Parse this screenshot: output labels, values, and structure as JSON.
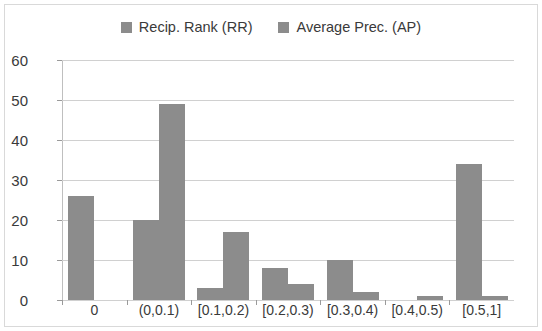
{
  "chart_data": {
    "type": "bar",
    "title": "",
    "subtitle": "",
    "xlabel": "",
    "ylabel": "",
    "categories": [
      "0",
      "(0,0.1)",
      "[0.1,0.2)",
      "[0.2,0.3)",
      "[0.3,0.4)",
      "[0.4,0.5)",
      "[0.5,1]"
    ],
    "series": [
      {
        "name": "Recip. Rank (RR)",
        "color": "#8c8c8c",
        "values": [
          26,
          20,
          3,
          8,
          10,
          0,
          34
        ]
      },
      {
        "name": "Average Prec. (AP)",
        "color": "#8c8c8c",
        "values": [
          0,
          49,
          17,
          4,
          2,
          1,
          1
        ]
      }
    ],
    "ylim": [
      0,
      60
    ],
    "yticks": [
      0,
      10,
      20,
      30,
      40,
      50,
      60
    ],
    "ytick_labels": [
      "0",
      "10",
      "20",
      "30",
      "40",
      "50",
      "60"
    ],
    "grid": true,
    "legend_position": "top"
  },
  "legend": {
    "entries": [
      {
        "label": "Recip. Rank (RR)",
        "swatch_color": "#8c8c8c"
      },
      {
        "label": "Average Prec. (AP)",
        "swatch_color": "#8c8c8c"
      }
    ]
  },
  "colors": {
    "bar": "#8c8c8c",
    "grid": "#d0d0d0",
    "axis": "#9a9a9a",
    "text": "#3a3a3a",
    "frame": "#d9d9d9",
    "background": "#ffffff"
  }
}
